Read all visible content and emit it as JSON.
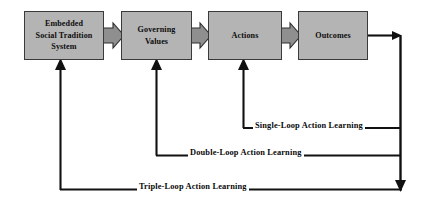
{
  "diagram": {
    "background_color": "#ffffff",
    "box_fill_color": "#b4b4b4",
    "box_border_color": "#3a3a3a",
    "connector_fill_color": "#8f8f8f",
    "line_color": "#111111",
    "nodes": [
      {
        "id": "embedded-social-tradition-system",
        "label": "Embedded\nSocial Tradition\nSystem"
      },
      {
        "id": "governing-values",
        "label": "Governing\nValues"
      },
      {
        "id": "actions",
        "label": "Actions"
      },
      {
        "id": "outcomes",
        "label": "Outcomes"
      }
    ],
    "connectors": [
      {
        "id": "arrow-embedded-to-governing",
        "from": "embedded-social-tradition-system",
        "to": "governing-values"
      },
      {
        "id": "arrow-governing-to-actions",
        "from": "governing-values",
        "to": "actions"
      },
      {
        "id": "arrow-actions-to-outcomes",
        "from": "actions",
        "to": "outcomes"
      }
    ],
    "feedback_loops": [
      {
        "id": "single-loop",
        "label": "Single-Loop Action Learning",
        "target": "actions"
      },
      {
        "id": "double-loop",
        "label": "Double-Loop Action Learning",
        "target": "governing-values"
      },
      {
        "id": "triple-loop",
        "label": "Triple-Loop Action Learning",
        "target": "embedded-social-tradition-system"
      }
    ]
  }
}
